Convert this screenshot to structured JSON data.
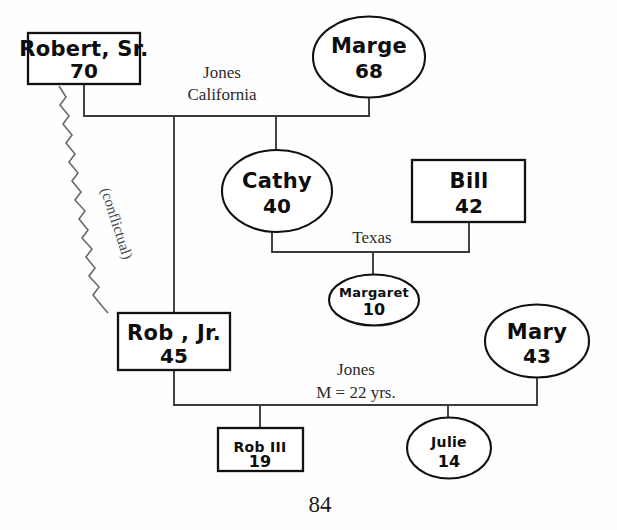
{
  "diagram": {
    "type": "genogram",
    "page_number": "84",
    "persons": [
      {
        "id": "robert_sr",
        "name": "Robert, Sr.",
        "age": "70",
        "shape": "box",
        "gender": "male",
        "cx": 84,
        "cy": 58,
        "w": 112,
        "h": 51
      },
      {
        "id": "marge",
        "name": "Marge",
        "age": "68",
        "shape": "ellipse",
        "gender": "female",
        "cx": 369,
        "cy": 57,
        "w": 112,
        "h": 81
      },
      {
        "id": "cathy",
        "name": "Cathy",
        "age": "40",
        "shape": "ellipse",
        "gender": "female",
        "cx": 277,
        "cy": 191,
        "w": 110,
        "h": 82
      },
      {
        "id": "bill",
        "name": "Bill",
        "age": "42",
        "shape": "box",
        "gender": "male",
        "cx": 469,
        "cy": 191,
        "w": 113,
        "h": 62
      },
      {
        "id": "margaret",
        "name": "Margaret",
        "age": "10",
        "shape": "ellipse",
        "gender": "female",
        "cx": 374,
        "cy": 300,
        "w": 90,
        "h": 51
      },
      {
        "id": "rob_jr",
        "name": "Rob , Jr.",
        "age": "45",
        "shape": "box",
        "gender": "male",
        "cx": 174,
        "cy": 341,
        "w": 112,
        "h": 57
      },
      {
        "id": "mary",
        "name": "Mary",
        "age": "43",
        "shape": "ellipse",
        "gender": "female",
        "cx": 537,
        "cy": 341,
        "w": 104,
        "h": 73
      },
      {
        "id": "rob_iii",
        "name": "Rob III",
        "age": "19",
        "shape": "box",
        "gender": "male",
        "cx": 260,
        "cy": 449,
        "w": 85,
        "h": 43
      },
      {
        "id": "julie",
        "name": "Julie",
        "age": "14",
        "shape": "ellipse",
        "gender": "female",
        "cx": 449,
        "cy": 448,
        "w": 84,
        "h": 61
      }
    ],
    "unions": [
      {
        "id": "union_robertsr_marge",
        "partners": [
          "robert_sr",
          "marge"
        ],
        "label_lines": [
          "Jones",
          "California"
        ],
        "label_x": 222,
        "label_line_y": [
          72,
          94
        ]
      },
      {
        "id": "union_cathy_bill",
        "partners": [
          "cathy",
          "bill"
        ],
        "label_lines": [
          "Texas"
        ],
        "label_x": 372,
        "label_line_y": [
          237
        ]
      },
      {
        "id": "union_robjr_mary",
        "partners": [
          "rob_jr",
          "mary"
        ],
        "label_lines": [
          "Jones",
          "M = 22 yrs."
        ],
        "label_x": 356,
        "label_line_y": [
          369,
          392
        ]
      }
    ],
    "relationships": [
      {
        "id": "rel_conflictual",
        "from": "robert_sr",
        "to": "rob_jr",
        "style": "zigzag",
        "label": "(conflictual)",
        "label_x": 112,
        "label_y": 225,
        "label_rotation": 72
      }
    ],
    "colors": {
      "background": "#fefefe",
      "ink": "#0d0d0d",
      "line": "#3a3a3a",
      "conflict_line": "#6a6a6a",
      "label_text": "#2b2b2b"
    }
  }
}
